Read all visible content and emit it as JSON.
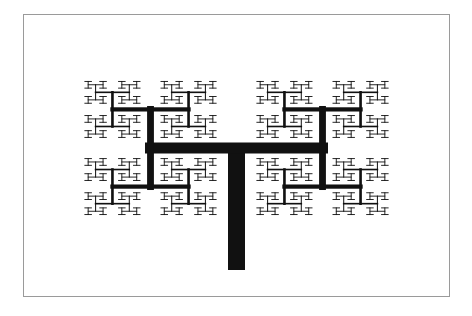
{
  "figure": {
    "colors": {
      "background": "#ffffff",
      "frame": "#9a9a9a",
      "ink": "#111111"
    },
    "trunk": {
      "x": 236.5,
      "y_bottom": 270,
      "y_top": 148,
      "width": 17
    },
    "root_branch": {
      "cx": 236.5,
      "cy": 148,
      "orientation": "horizontal",
      "half_length": 86,
      "thickness": 11
    },
    "recursion": {
      "depth": 9,
      "length_ratio": 0.68,
      "thickness_ratio": 0.62,
      "min_thickness": 0.9
    }
  }
}
